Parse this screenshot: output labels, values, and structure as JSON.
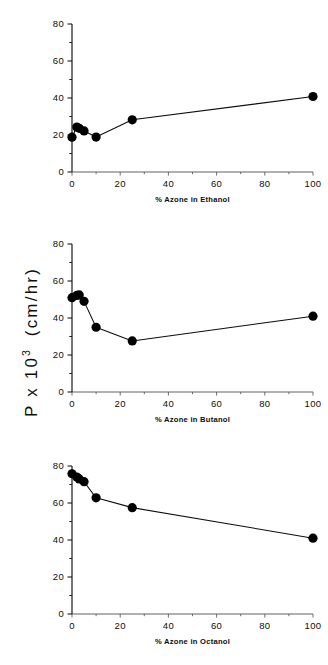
{
  "figure": {
    "name": "azone-permeability-figure",
    "y_axis_label_prefix": "P x 10",
    "y_axis_label_exponent": "3",
    "y_axis_label_units": "(cm/hr)"
  },
  "chart_data": [
    {
      "type": "line",
      "title": "",
      "xlabel": "% Azone in Ethanol",
      "ylabel": "P x 10^3 (cm/hr)",
      "xlim": [
        0,
        100
      ],
      "ylim": [
        0,
        80
      ],
      "xticks": [
        0,
        20,
        40,
        60,
        80,
        100
      ],
      "yticks": [
        0,
        20,
        40,
        60,
        80
      ],
      "xticklabels": [
        "0",
        "20",
        "40",
        "60",
        "80",
        "100"
      ],
      "yticklabels": [
        "0",
        "20",
        "40",
        "60",
        "80"
      ],
      "grid": false,
      "legend": false,
      "marker": "filled-circle",
      "x": [
        0,
        2,
        3,
        5,
        10,
        25,
        100
      ],
      "y": [
        18.8,
        24.3,
        23.6,
        22.2,
        18.9,
        28.2,
        40.8
      ]
    },
    {
      "type": "line",
      "title": "",
      "xlabel": "% Azone in Butanol",
      "ylabel": "P x 10^3 (cm/hr)",
      "xlim": [
        0,
        100
      ],
      "ylim": [
        0,
        80
      ],
      "xticks": [
        0,
        20,
        40,
        60,
        80,
        100
      ],
      "yticks": [
        0,
        20,
        40,
        60,
        80
      ],
      "xticklabels": [
        "0",
        "20",
        "40",
        "60",
        "80",
        "100"
      ],
      "yticklabels": [
        "0",
        "20",
        "40",
        "60",
        "80"
      ],
      "grid": false,
      "legend": false,
      "marker": "filled-circle",
      "x": [
        0,
        2,
        3,
        5,
        10,
        25,
        100
      ],
      "y": [
        51.0,
        52.2,
        52.5,
        49.0,
        35.0,
        27.6,
        41.0
      ]
    },
    {
      "type": "line",
      "title": "",
      "xlabel": "% Azone in Octanol",
      "ylabel": "P x 10^3 (cm/hr)",
      "xlim": [
        0,
        100
      ],
      "ylim": [
        0,
        80
      ],
      "xticks": [
        0,
        20,
        40,
        60,
        80,
        100
      ],
      "yticks": [
        0,
        20,
        40,
        60,
        80
      ],
      "xticklabels": [
        "0",
        "20",
        "40",
        "60",
        "80",
        "100"
      ],
      "yticklabels": [
        "0",
        "20",
        "40",
        "60",
        "80"
      ],
      "grid": false,
      "legend": false,
      "marker": "filled-circle",
      "x": [
        0,
        2,
        3,
        5,
        10,
        25,
        100
      ],
      "y": [
        75.8,
        74.0,
        73.0,
        71.5,
        62.8,
        57.5,
        41.0
      ]
    }
  ]
}
